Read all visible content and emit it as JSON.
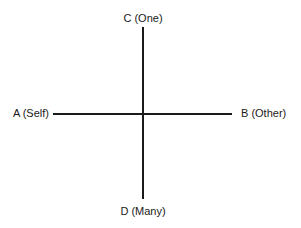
{
  "diagram": {
    "type": "quadrant-axes",
    "axes": {
      "vertical": {
        "top_label": "C (One)",
        "bottom_label": "D (Many)"
      },
      "horizontal": {
        "left_label": "A (Self)",
        "right_label": "B (Other)"
      }
    },
    "colors": {
      "line": "#1a1a1a",
      "text": "#1a1a1a",
      "background": "#ffffff"
    }
  }
}
